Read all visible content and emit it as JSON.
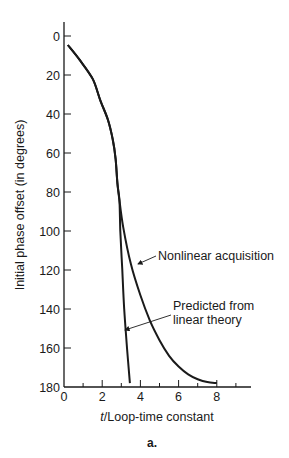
{
  "chart_data": {
    "type": "line",
    "title": "",
    "caption": "a.",
    "xlabel_italic": "t",
    "xlabel_rest": "/Loop-time constant",
    "xlabel": "t/Loop-time constant",
    "ylabel": "Initial phase offset (in degrees)",
    "xlim": [
      0,
      9.5
    ],
    "ylim": [
      0,
      180
    ],
    "y_inverted": true,
    "grid": false,
    "x_ticks": [
      0,
      2,
      4,
      6,
      8
    ],
    "x_minor_ticks": [
      1,
      3,
      5,
      7,
      9
    ],
    "y_ticks": [
      0,
      20,
      40,
      60,
      80,
      100,
      120,
      140,
      160,
      180
    ],
    "series": [
      {
        "name": "Nonlinear acquisition",
        "x": [
          0.2,
          0.8,
          1.5,
          1.9,
          2.3,
          2.55,
          2.7,
          2.8,
          2.9,
          3.1,
          3.5,
          4.0,
          4.5,
          5.0,
          5.5,
          6.0,
          6.5,
          7.0,
          7.5,
          8.0
        ],
        "values": [
          4.6,
          12,
          22,
          33,
          43,
          53,
          63,
          76,
          84,
          98,
          117,
          133,
          146,
          156,
          164,
          169.5,
          173.5,
          176,
          177.5,
          178
        ]
      },
      {
        "name": "Predicted from linear theory",
        "x": [
          0.2,
          0.8,
          1.5,
          1.9,
          2.3,
          2.55,
          2.7,
          2.8,
          2.9,
          2.95,
          3.05,
          3.15,
          3.3,
          3.45
        ],
        "values": [
          4.6,
          12,
          22,
          33,
          43,
          53,
          63,
          76,
          84,
          100,
          120,
          140,
          160,
          178
        ]
      }
    ],
    "annotations": [
      {
        "text": "Nonlinear acquisition",
        "points_to": "Nonlinear acquisition"
      },
      {
        "text_line1": "Predicted from",
        "text_line2": "linear theory",
        "points_to": "Predicted from linear theory"
      }
    ]
  }
}
